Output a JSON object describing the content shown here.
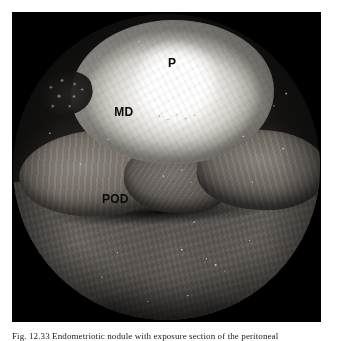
{
  "figure": {
    "modality": "laparoscopic-photograph",
    "color_mode": "grayscale",
    "field_of_view": "circular",
    "annotations": [
      {
        "key": "p",
        "label": "P",
        "meaning": "peritoneum"
      },
      {
        "key": "md",
        "label": "MD",
        "meaning": "mass / dome"
      },
      {
        "key": "pod",
        "label": "POD",
        "meaning": "pouch of Douglas"
      }
    ]
  },
  "caption": {
    "figure_number": "Fig. 12.33",
    "text": "Endometriotic nodule with exposure section of the peritoneal",
    "full_line": "Fig. 12.33  Endometriotic nodule with exposure section of the peritoneal"
  },
  "colors": {
    "page_background": "#ffffff",
    "frame_background": "#000000",
    "annotation_text": "#0a0a0a",
    "caption_text": "#1a1a1a"
  }
}
